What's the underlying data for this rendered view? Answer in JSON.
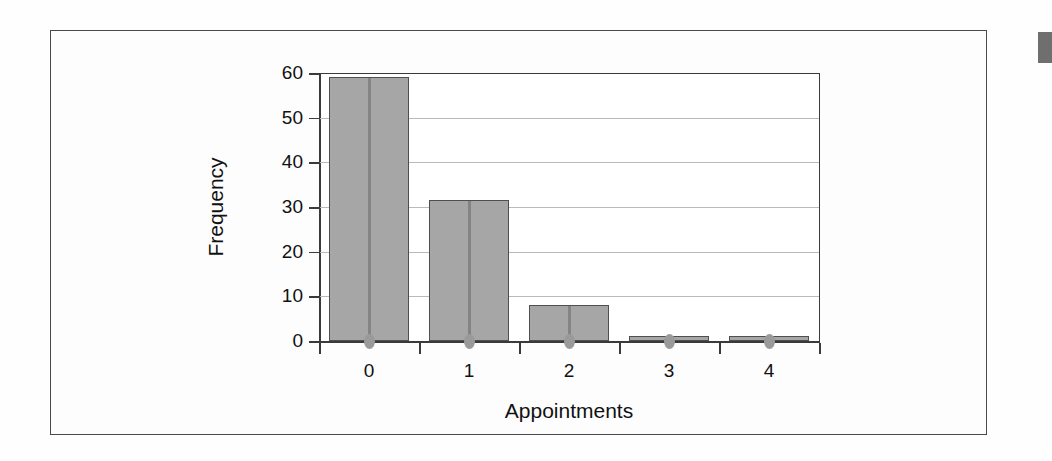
{
  "figure": {
    "frame_border_color": "#4a4a4a",
    "background_color": "#fdfdfd",
    "edge_marker_color": "#6f6f6f"
  },
  "chart_data": {
    "type": "bar",
    "title": "",
    "xlabel": "Appointments",
    "ylabel": "Frequency",
    "categories": [
      "0",
      "1",
      "2",
      "3",
      "4"
    ],
    "values": [
      59,
      31.5,
      8,
      1.2,
      1.2
    ],
    "ylim": [
      0,
      60
    ],
    "yticks": [
      "0",
      "10",
      "20",
      "30",
      "40",
      "50",
      "60"
    ],
    "ytick_values": [
      0,
      10,
      20,
      30,
      40,
      50,
      60
    ],
    "grid": "horizontal",
    "legend": "none",
    "bar_color": "#a6a6a6",
    "bar_edge_color": "#4f4f4f",
    "gridline_color": "#b9b9b9",
    "axis_color": "#3a3a3a"
  }
}
